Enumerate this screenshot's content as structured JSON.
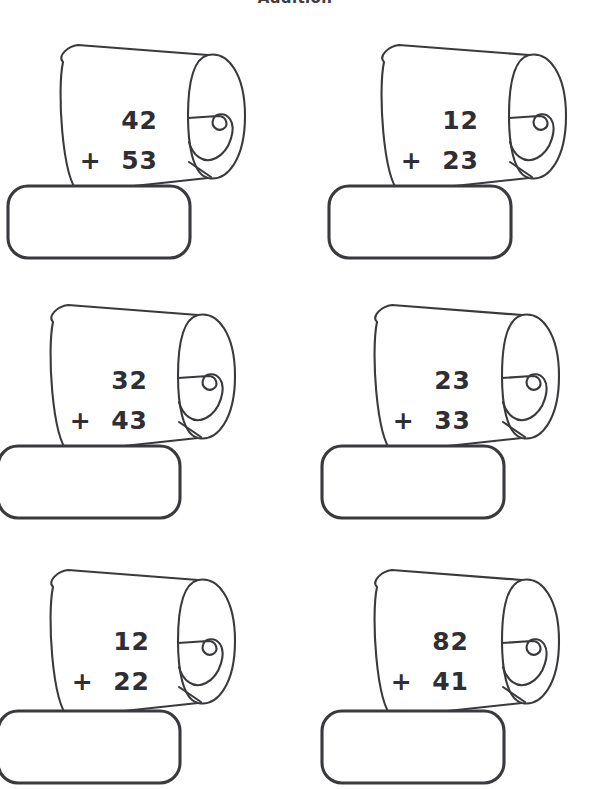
{
  "page": {
    "title": "Addition",
    "title_truncated": true,
    "background_color": "#ffffff",
    "ink_color": "#3a3a3e",
    "text_color": "#2f2f33",
    "width": 590,
    "height": 782
  },
  "worksheet": {
    "subject": "Addition",
    "columns": 2,
    "rows": 3,
    "operator": "+",
    "answer_box_value": "",
    "problems": [
      {
        "index": 1,
        "addend_top": "42",
        "operator": "+",
        "addend_bottom": "53",
        "answer": "",
        "row": 1,
        "column": 1
      },
      {
        "index": 2,
        "addend_top": "12",
        "operator": "+",
        "addend_bottom": "23",
        "answer": "",
        "row": 1,
        "column": 2
      },
      {
        "index": 3,
        "addend_top": "32",
        "operator": "+",
        "addend_bottom": "43",
        "answer": "",
        "row": 2,
        "column": 1
      },
      {
        "index": 4,
        "addend_top": "23",
        "operator": "+",
        "addend_bottom": "33",
        "answer": "",
        "row": 2,
        "column": 2
      },
      {
        "index": 5,
        "addend_top": "12",
        "operator": "+",
        "addend_bottom": "22",
        "answer": "",
        "row": 3,
        "column": 1
      },
      {
        "index": 6,
        "addend_top": "82",
        "operator": "+",
        "addend_bottom": "41",
        "answer": "",
        "row": 3,
        "column": 2
      }
    ]
  },
  "icons": {
    "scroll": "scroll-icon",
    "scroll_curl": "scroll-curl-icon"
  }
}
